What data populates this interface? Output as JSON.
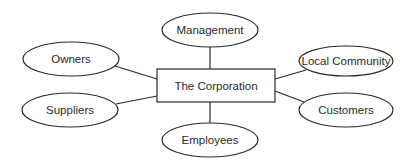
{
  "diagram": {
    "center": {
      "label": "The Corporation",
      "x": 216,
      "y": 86
    },
    "nodes": [
      {
        "id": "management",
        "label": "Management",
        "x": 210,
        "y": 30
      },
      {
        "id": "owners",
        "label": "Owners",
        "x": 71,
        "y": 59
      },
      {
        "id": "local_community",
        "label": "Local Community",
        "x": 346,
        "y": 61
      },
      {
        "id": "suppliers",
        "label": "Suppliers",
        "x": 70,
        "y": 110
      },
      {
        "id": "customers",
        "label": "Customers",
        "x": 346,
        "y": 110
      },
      {
        "id": "employees",
        "label": "Employees",
        "x": 210,
        "y": 140
      }
    ],
    "stroke_color": "#2a2a2a"
  }
}
